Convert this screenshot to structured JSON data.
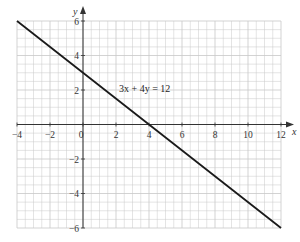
{
  "chart_data": {
    "type": "line",
    "title": "",
    "xlabel": "x",
    "ylabel": "y",
    "xlim": [
      -4,
      12
    ],
    "ylim": [
      -6,
      6
    ],
    "grid": true,
    "grid_minor_step": 0.5,
    "x_ticks": [
      -4,
      -2,
      0,
      2,
      4,
      6,
      8,
      10,
      12
    ],
    "x_tick_labels": [
      "−4",
      "−2",
      "0",
      "2",
      "4",
      "6",
      "8",
      "10",
      "12"
    ],
    "y_ticks": [
      6,
      4,
      2,
      -2,
      -4,
      -6
    ],
    "y_tick_labels": [
      "6",
      "4",
      "2",
      "−2",
      "−4",
      "−6"
    ],
    "series": [
      {
        "name": "3x + 4y = 12",
        "x": [
          -4,
          0,
          4,
          12
        ],
        "y": [
          6,
          3,
          0,
          -6
        ]
      }
    ],
    "annotations": [
      {
        "text": "3x + 4y = 12",
        "x": 2.2,
        "y": 2
      }
    ],
    "legend": "none"
  },
  "labels": {
    "x_axis": "x",
    "y_axis": "y",
    "equation": "3x + 4y = 12"
  },
  "colors": {
    "grid": "#c8c8c8",
    "axis": "#333333",
    "line": "#1a1a1a"
  }
}
